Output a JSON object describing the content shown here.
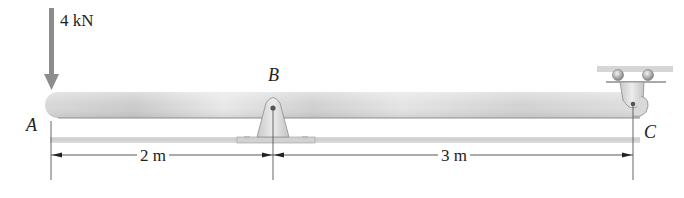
{
  "diagram": {
    "type": "beam-statics",
    "load": {
      "label": "4 kN",
      "point": "A",
      "direction": "down"
    },
    "points": [
      {
        "id": "A",
        "label": "A",
        "role": "free-end"
      },
      {
        "id": "B",
        "label": "B",
        "role": "pin-support"
      },
      {
        "id": "C",
        "label": "C",
        "role": "hanging-pin-bracket"
      }
    ],
    "dimensions": [
      {
        "from": "A",
        "to": "B",
        "label": "2 m"
      },
      {
        "from": "B",
        "to": "C",
        "label": "3 m"
      }
    ],
    "colors": {
      "beam_light": "#e6e6e6",
      "beam_mid": "#cfcfcf",
      "beam_edge": "#9a9a9a",
      "arrow": "#8c8c8c",
      "support": "#d9d9d9",
      "line": "#444444",
      "shadow": "#d4d4d4"
    }
  }
}
